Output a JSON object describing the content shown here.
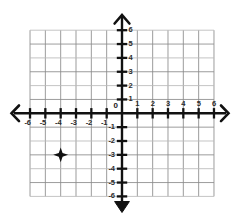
{
  "figure": {
    "type": "cartesian-grid"
  },
  "chart_data": {
    "type": "scatter",
    "title": "",
    "xlabel": "",
    "ylabel": "",
    "xlim": [
      -6,
      6
    ],
    "ylim": [
      -6,
      6
    ],
    "grid": true,
    "legend": null,
    "x_ticks": [
      -6,
      -5,
      -4,
      -3,
      -2,
      -1,
      1,
      2,
      3,
      4,
      5,
      6
    ],
    "y_ticks": [
      -6,
      -5,
      -4,
      -3,
      -2,
      -1,
      1,
      2,
      3,
      4,
      5,
      6
    ],
    "x_tick_labels": [
      "-6",
      "-5",
      "-4",
      "-3",
      "-2",
      "-1",
      "1",
      "2",
      "3",
      "4",
      "5",
      "6"
    ],
    "y_tick_labels": [
      "-6",
      "-5",
      "-4",
      "-3",
      "-2",
      "-1",
      "1",
      "2",
      "3",
      "4",
      "5",
      "6"
    ],
    "origin_label": "0",
    "points": [
      {
        "x": -4,
        "y": -3,
        "marker": "four-point-star",
        "color": "#111111",
        "label": ""
      }
    ],
    "series": [
      {
        "name": "plotted point",
        "x": [
          -4
        ],
        "y": [
          -3
        ]
      }
    ]
  },
  "axes": {
    "x_axis_name": "x-axis",
    "y_axis_name": "y-axis",
    "arrow_left": "❮",
    "arrow_right": "❯",
    "arrow_up": "⌃",
    "arrow_down": "▼",
    "axis_color": "#111111",
    "grid_color": "#8a8a8a",
    "grid_color_light": "#b9b9b9"
  },
  "labels": {
    "x_positive": [
      "1",
      "2",
      "3",
      "4",
      "5",
      "6"
    ],
    "x_negative": [
      "-6",
      "-5",
      "-4",
      "-3",
      "-2",
      "-1"
    ],
    "y_positive": [
      "1",
      "2",
      "3",
      "4",
      "5",
      "6"
    ],
    "y_negative": [
      "-1",
      "-2",
      "-3",
      "-4",
      "-5",
      "-6"
    ],
    "origin": "0"
  }
}
